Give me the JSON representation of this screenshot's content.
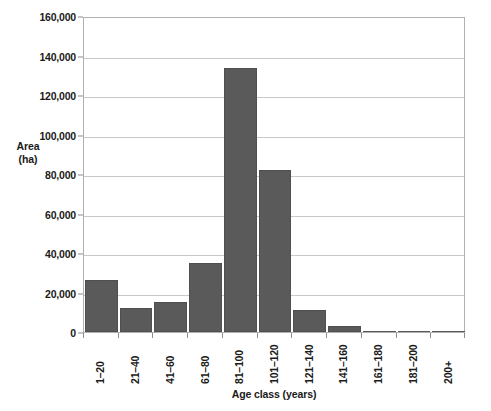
{
  "chart_data": {
    "type": "bar",
    "title": "",
    "xlabel": "Age class (years)",
    "ylabel": "Area (ha)",
    "ylabel_lines": [
      "Area",
      "(ha)"
    ],
    "categories": [
      "1–20",
      "21–40",
      "41–60",
      "61–80",
      "81–100",
      "101–120",
      "121–140",
      "141–160",
      "161–180",
      "181–200",
      "200+"
    ],
    "values": [
      26300,
      12000,
      15000,
      35000,
      133700,
      82000,
      11300,
      3000,
      600,
      200,
      100
    ],
    "ylim": [
      0,
      160000
    ],
    "ytick_labels": [
      "0",
      "20,000",
      "40,000",
      "60,000",
      "80,000",
      "100,000",
      "120,000",
      "140,000",
      "160,000"
    ],
    "ytick_values": [
      0,
      20000,
      40000,
      60000,
      80000,
      100000,
      120000,
      140000,
      160000
    ],
    "grid": true,
    "legend": false,
    "bar_color": "#5a5a5a",
    "grid_color": "#c8c8c8",
    "axis_color": "#b0b0b0"
  }
}
